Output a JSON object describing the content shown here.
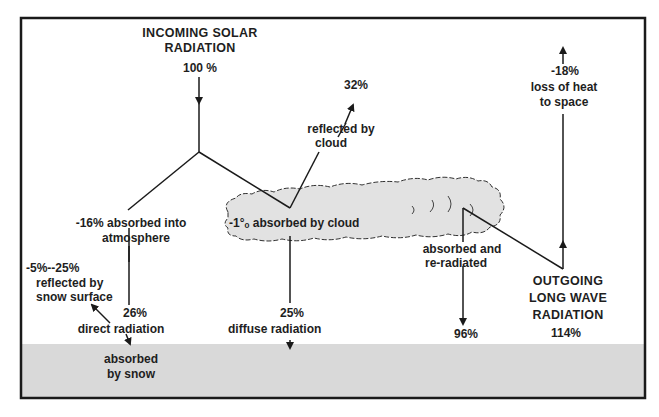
{
  "diagram": {
    "title_line1": "INCOMING SOLAR",
    "title_line2": "RADIATION",
    "incoming_value": "100 %",
    "reflected_cloud_value": "32%",
    "reflected_cloud_line1": "reflected by",
    "reflected_cloud_line2": "cloud",
    "loss_value": "-18%",
    "loss_line1": "loss of heat",
    "loss_line2": "to space",
    "absorbed_atmos_line1": "-16% absorbed  into",
    "absorbed_atmos_line2": "atmosphere",
    "cloud_label": "-1°ₒ absorbed  by cloud",
    "snow_reflect_value": "-5%--25%",
    "snow_reflect_line1": "reflected  by",
    "snow_reflect_line2": "snow  surface",
    "direct_value": "26%",
    "direct_label": "direct  radiation",
    "diffuse_value": "25%",
    "diffuse_label": "diffuse  radiation",
    "reradiated_line1": "absorbed and",
    "reradiated_line2": "re-radiated",
    "reradiated_value": "96%",
    "outgoing_line1": "OUTGOING",
    "outgoing_line2": "LONG  WAVE",
    "outgoing_line3": "RADIATION",
    "outgoing_value": "114%",
    "absorbed_snow_line1": "absorbed",
    "absorbed_snow_line2": "by snow"
  },
  "colors": {
    "ground": "#d9d9d9",
    "cloud": "#e2e2e2",
    "line": "#1a1a1a"
  }
}
